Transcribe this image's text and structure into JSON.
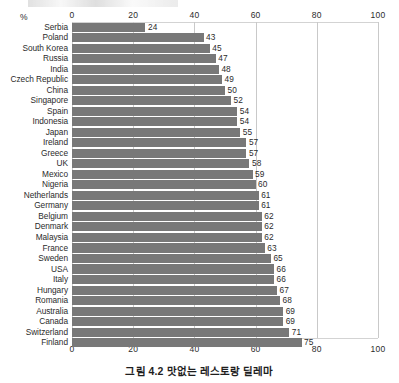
{
  "figure": {
    "caption": "그림 4.2 맛없는 레스토랑 딜레마",
    "unit_label": "%"
  },
  "chart_data": {
    "type": "bar",
    "orientation": "horizontal",
    "title": "그림 4.2 맛없는 레스토랑 딜레마",
    "xlabel": "%",
    "ylabel": "",
    "xlim": [
      0,
      100
    ],
    "xticks": [
      0,
      20,
      40,
      60,
      80,
      100
    ],
    "xtick_labels": [
      "0",
      "20",
      "40",
      "60",
      "80",
      "100"
    ],
    "axis_positions": [
      "top",
      "bottom"
    ],
    "grid": true,
    "grid_axis": "x",
    "legend": false,
    "bar_color": "#787878",
    "value_labels": true,
    "categories": [
      "Serbia",
      "Poland",
      "South Korea",
      "Russia",
      "India",
      "Czech Republic",
      "China",
      "Singapore",
      "Spain",
      "Indonesia",
      "Japan",
      "Ireland",
      "Greece",
      "UK",
      "Mexico",
      "Nigeria",
      "Netherlands",
      "Germany",
      "Belgium",
      "Denmark",
      "Malaysia",
      "France",
      "Sweden",
      "USA",
      "Italy",
      "Hungary",
      "Romania",
      "Australia",
      "Canada",
      "Switzerland",
      "Finland"
    ],
    "values": [
      24,
      43,
      45,
      47,
      48,
      49,
      50,
      52,
      54,
      54,
      55,
      57,
      57,
      58,
      59,
      60,
      61,
      61,
      62,
      62,
      62,
      63,
      65,
      66,
      66,
      67,
      68,
      69,
      69,
      71,
      75
    ]
  }
}
